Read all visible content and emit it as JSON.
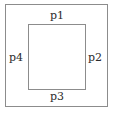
{
  "diagram": {
    "type": "geometric-diagram",
    "background_color": "#ffffff",
    "stroke_color": "#8c8c8c",
    "text_color": "#2b2b2b",
    "shapes": [
      {
        "name": "outer-square",
        "shape": "rectangle",
        "x": 5,
        "y": 4,
        "width": 103,
        "height": 103,
        "fill": "none",
        "stroke": "#8c8c8c"
      },
      {
        "name": "inner-square",
        "shape": "rectangle",
        "x": 28,
        "y": 24,
        "width": 58,
        "height": 66,
        "fill": "none",
        "stroke": "#8c8c8c"
      }
    ],
    "labels": {
      "top": "p1",
      "right": "p2",
      "bottom": "p3",
      "left": "p4"
    }
  }
}
